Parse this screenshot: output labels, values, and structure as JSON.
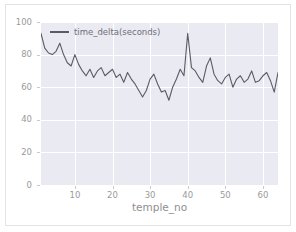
{
  "figure": {
    "background_color": "#ffffff",
    "border_color": "#e3e3e3",
    "plot_background_color": "#eaeaf2",
    "grid_color": "#ffffff",
    "line_color": "#5b5b66",
    "tick_color": "#9a9a9a"
  },
  "legend": {
    "label": "time_delta(seconds)",
    "position": "upper-left"
  },
  "chart_data": {
    "type": "line",
    "title": "",
    "xlabel": "temple_no",
    "ylabel": "",
    "xlim": [
      1,
      64
    ],
    "ylim": [
      0,
      100
    ],
    "xticks": [
      10,
      20,
      30,
      40,
      50,
      60
    ],
    "yticks": [
      0,
      20,
      40,
      60,
      80,
      100
    ],
    "grid": true,
    "legend_position": "upper-left",
    "series": [
      {
        "name": "time_delta(seconds)",
        "x": [
          1,
          2,
          3,
          4,
          5,
          6,
          7,
          8,
          9,
          10,
          11,
          12,
          13,
          14,
          15,
          16,
          17,
          18,
          19,
          20,
          21,
          22,
          23,
          24,
          25,
          26,
          27,
          28,
          29,
          30,
          31,
          32,
          33,
          34,
          35,
          36,
          37,
          38,
          39,
          40,
          41,
          42,
          43,
          44,
          45,
          46,
          47,
          48,
          49,
          50,
          51,
          52,
          53,
          54,
          55,
          56,
          57,
          58,
          59,
          60,
          61,
          62,
          63,
          64
        ],
        "values": [
          93,
          84,
          81,
          80,
          82,
          87,
          80,
          75,
          73,
          80,
          74,
          70,
          67,
          71,
          66,
          70,
          72,
          67,
          69,
          71,
          66,
          68,
          63,
          69,
          65,
          62,
          58,
          54,
          58,
          65,
          68,
          62,
          57,
          58,
          52,
          60,
          65,
          71,
          67,
          93,
          72,
          70,
          66,
          63,
          73,
          78,
          68,
          64,
          62,
          66,
          68,
          60,
          65,
          67,
          63,
          65,
          70,
          63,
          64,
          67,
          69,
          64,
          57,
          69
        ]
      }
    ]
  },
  "ytick_labels": [
    "0",
    "20",
    "40",
    "60",
    "80",
    "100"
  ],
  "xtick_labels": [
    "10",
    "20",
    "30",
    "40",
    "50",
    "60"
  ]
}
